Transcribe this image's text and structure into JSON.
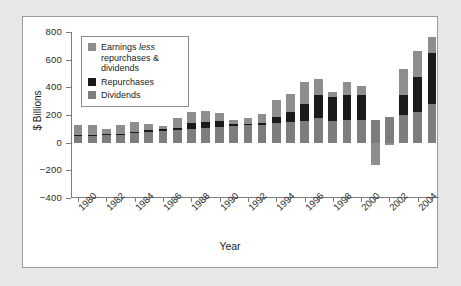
{
  "chart_data": {
    "type": "bar",
    "subtype": "stacked-bar",
    "title": "",
    "xlabel": "Year",
    "ylabel": "$ Billions",
    "ylim": [
      -400,
      800
    ],
    "yticks": [
      800,
      600,
      400,
      200,
      0,
      -200,
      -400
    ],
    "ytick_labels": [
      "800",
      "600",
      "400",
      "200",
      "0",
      "-200",
      "-400"
    ],
    "grid": false,
    "legend_position": "upper left",
    "categories": [
      "1980",
      "1981",
      "1982",
      "1983",
      "1984",
      "1985",
      "1986",
      "1987",
      "1988",
      "1989",
      "1990",
      "1991",
      "1992",
      "1993",
      "1994",
      "1995",
      "1996",
      "1997",
      "1998",
      "1999",
      "2000",
      "2001",
      "2002",
      "2003",
      "2004",
      "2005"
    ],
    "xtick_labels": [
      "1980",
      "1982",
      "1984",
      "1986",
      "1988",
      "1990",
      "1992",
      "1994",
      "1996",
      "1998",
      "2000",
      "2002",
      "2004"
    ],
    "series": [
      {
        "name": "Dividends",
        "color": "#7d7d7d",
        "values": [
          48,
          50,
          55,
          58,
          68,
          80,
          82,
          88,
          98,
          108,
          112,
          120,
          128,
          128,
          140,
          152,
          158,
          175,
          160,
          162,
          165,
          165,
          182,
          198,
          222,
          282
        ]
      },
      {
        "name": "Repurchases",
        "color": "#1a1a1a",
        "values": [
          6,
          6,
          6,
          6,
          6,
          8,
          18,
          18,
          42,
          42,
          42,
          12,
          10,
          12,
          44,
          68,
          122,
          170,
          172,
          185,
          182,
          0,
          0,
          148,
          255,
          368
        ]
      },
      {
        "name": "Earnings less repurchases & dividends",
        "color": "#8e8e8e",
        "values": [
          76,
          70,
          38,
          62,
          76,
          50,
          20,
          72,
          82,
          78,
          62,
          35,
          38,
          70,
          122,
          135,
          155,
          115,
          32,
          92,
          62,
          -165,
          -20,
          185,
          185,
          112
        ]
      }
    ]
  },
  "legend": {
    "items": [
      {
        "label_html": "Earnings <em>less</em> repurchases &amp; dividends",
        "color": "#8e8e8e",
        "name": "earnings-less"
      },
      {
        "label_html": "Repurchases",
        "color": "#1a1a1a",
        "name": "repurchases"
      },
      {
        "label_html": "Dividends",
        "color": "#7d7d7d",
        "name": "dividends"
      }
    ]
  },
  "colors": {
    "figure_background": "#ffffff",
    "page_background": "#e8e8e8",
    "frame_border": "#9a9a9a",
    "axis": "#7d7d7d",
    "text": "#1d1d1d"
  }
}
